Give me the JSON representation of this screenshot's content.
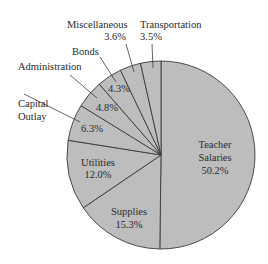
{
  "chart_data": {
    "type": "pie",
    "title": "",
    "categories": [
      "Teacher Salaries",
      "Supplies",
      "Utilities",
      "Capital Outlay",
      "Administration",
      "Bonds",
      "Miscellaneous",
      "Transportation"
    ],
    "values": [
      50.2,
      15.3,
      12.0,
      6.3,
      4.8,
      4.3,
      3.6,
      3.5
    ],
    "labels": [
      "50.2%",
      "15.3%",
      "12.0%",
      "6.3%",
      "4.8%",
      "4.3%",
      "3.6%",
      "3.5%"
    ],
    "start_angle_deg": 0,
    "direction": "clockwise from 12 o'clock",
    "fill_color": "#bdbdbd",
    "stroke_color": "#3a3a3a"
  },
  "labels": {
    "teacher_l1": "Teacher",
    "teacher_l2": "Salaries",
    "teacher_pct": "50.2%",
    "supplies": "Supplies",
    "supplies_pct": "15.3%",
    "utilities": "Utilities",
    "utilities_pct": "12.0%",
    "capital_l1": "Capital",
    "capital_l2": "Outlay",
    "capital_pct": "6.3%",
    "admin": "Administration",
    "admin_pct": "4.8%",
    "bonds": "Bonds",
    "bonds_pct": "4.3%",
    "misc": "Miscellaneous",
    "misc_pct": "3.6%",
    "transport": "Transportation",
    "transport_pct": "3.5%"
  }
}
